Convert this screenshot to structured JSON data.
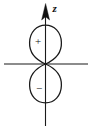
{
  "diagram": {
    "background_color": "#ffffff",
    "stroke_color": "#1a1a1a",
    "axes": {
      "vertical": {
        "name": "z-axis",
        "label": "z",
        "label_style": "italic",
        "has_arrowhead": true,
        "arrow_direction": "up",
        "x": 45.5,
        "y_top": 6,
        "y_bottom": 126
      },
      "horizontal": {
        "name": "horizontal-axis",
        "label": "",
        "has_arrowhead": false,
        "y": 64,
        "x_left": 4,
        "x_right": 88
      }
    },
    "lobes": [
      {
        "name": "upper-lobe",
        "sign": "+",
        "sign_x": 38,
        "sign_y": 40,
        "top_y": 25,
        "half_width": 16,
        "widest_y": 44
      },
      {
        "name": "lower-lobe",
        "sign": "−",
        "sign_x": 39,
        "sign_y": 88,
        "bottom_y": 105,
        "half_width": 16,
        "widest_y": 85
      }
    ],
    "node_point": {
      "name": "origin-node",
      "x": 45.5,
      "y": 64
    }
  }
}
